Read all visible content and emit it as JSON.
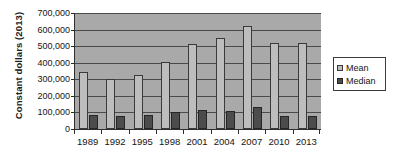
{
  "chart_data": {
    "type": "bar",
    "title": "",
    "subtitle": "",
    "xlabel": "",
    "ylabel": "Constant dollars (2013)",
    "categories": [
      "1989",
      "1992",
      "1995",
      "1998",
      "2001",
      "2004",
      "2007",
      "2010",
      "2013"
    ],
    "series": [
      {
        "name": "Mean",
        "color": "#bdbdbd",
        "values": [
          345000,
          300000,
          325000,
          402000,
          515000,
          548000,
          622000,
          520000,
          520000
        ]
      },
      {
        "name": "Median",
        "color": "#4c4c4c",
        "values": [
          85000,
          80000,
          85000,
          100000,
          112000,
          110000,
          130000,
          80000,
          78000
        ]
      }
    ],
    "ylim": [
      0,
      700000
    ],
    "ytick_step": 100000,
    "ytick_labels": [
      "700,000",
      "600,000",
      "500,000",
      "400,000",
      "300,000",
      "200,000",
      "100,000",
      "0"
    ],
    "ytick_values": [
      700000,
      600000,
      500000,
      400000,
      300000,
      200000,
      100000,
      0
    ],
    "grid": true,
    "grid_axis": "y",
    "legend_position": "right",
    "plot_background": "#a9a9a9",
    "figure_background": "#ffffff",
    "axis_color": "#2e2e2e"
  },
  "legend": {
    "entries": [
      {
        "label": "Mean",
        "swatch": "mean"
      },
      {
        "label": "Median",
        "swatch": "median"
      }
    ]
  }
}
